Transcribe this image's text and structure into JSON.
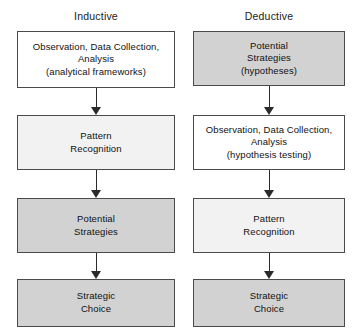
{
  "diagram": {
    "columns": [
      {
        "id": "inductive",
        "heading": "Inductive",
        "nodes": [
          {
            "id": "ind-1",
            "label": "Observation, Data Collection,\nAnalysis\n(analytical frameworks)",
            "fill": "#ffffff",
            "fill_class": "fill-white"
          },
          {
            "id": "ind-2",
            "label": "Pattern\nRecognition",
            "fill": "#f2f2f2",
            "fill_class": "fill-faint"
          },
          {
            "id": "ind-3",
            "label": "Potential\nStrategies",
            "fill": "#d2d2d2",
            "fill_class": "fill-gray"
          },
          {
            "id": "ind-4",
            "label": "Strategic\nChoice",
            "fill": "#d2d2d2",
            "fill_class": "fill-gray"
          }
        ],
        "arrows": [
          {
            "id": "ind-arrow-1",
            "from": "ind-1",
            "to": "ind-2"
          },
          {
            "id": "ind-arrow-2",
            "from": "ind-2",
            "to": "ind-3"
          },
          {
            "id": "ind-arrow-3",
            "from": "ind-3",
            "to": "ind-4"
          }
        ]
      },
      {
        "id": "deductive",
        "heading": "Deductive",
        "nodes": [
          {
            "id": "ded-1",
            "label": "Potential\nStrategies\n(hypotheses)",
            "fill": "#d2d2d2",
            "fill_class": "fill-gray"
          },
          {
            "id": "ded-2",
            "label": "Observation, Data Collection,\nAnalysis\n(hypothesis testing)",
            "fill": "#ffffff",
            "fill_class": "fill-white"
          },
          {
            "id": "ded-3",
            "label": "Pattern\nRecognition",
            "fill": "#f2f2f2",
            "fill_class": "fill-faint"
          },
          {
            "id": "ded-4",
            "label": "Strategic\nChoice",
            "fill": "#d2d2d2",
            "fill_class": "fill-gray"
          }
        ],
        "arrows": [
          {
            "id": "ded-arrow-1",
            "from": "ded-1",
            "to": "ded-2"
          },
          {
            "id": "ded-arrow-2",
            "from": "ded-2",
            "to": "ded-3"
          },
          {
            "id": "ded-arrow-3",
            "from": "ded-3",
            "to": "ded-4"
          }
        ]
      }
    ],
    "colors": {
      "border": "#4a4a4a",
      "arrow": "#2b2b2b",
      "text": "#111111",
      "background": "#ffffff"
    }
  }
}
